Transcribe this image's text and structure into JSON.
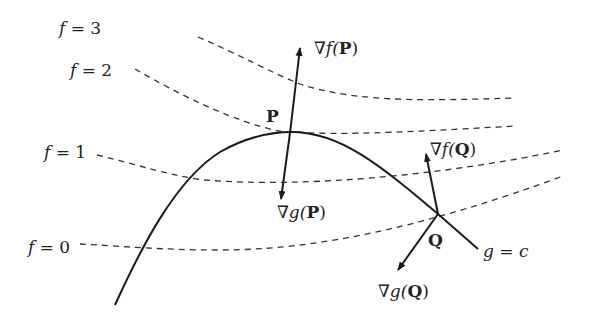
{
  "diagram": {
    "level_curves": [
      {
        "label_f": "f",
        "label_eq": " = ",
        "label_val": "3"
      },
      {
        "label_f": "f",
        "label_eq": " = ",
        "label_val": "2"
      },
      {
        "label_f": "f",
        "label_eq": " = ",
        "label_val": "1"
      },
      {
        "label_f": "f",
        "label_eq": " = ",
        "label_val": "0"
      }
    ],
    "constraint": {
      "g": "g",
      "eq": " = ",
      "c": "c"
    },
    "points": {
      "P": {
        "name": "P",
        "grad_f_prefix": "∇f(",
        "grad_g_prefix": "∇g(",
        "suffix": ")"
      },
      "Q": {
        "name": "Q",
        "grad_f_prefix": "∇f(",
        "grad_g_prefix": "∇g(",
        "suffix": ")"
      }
    },
    "colors": {
      "stroke": "#1a1a1a",
      "dashed": "#333333",
      "text": "#222222"
    }
  }
}
